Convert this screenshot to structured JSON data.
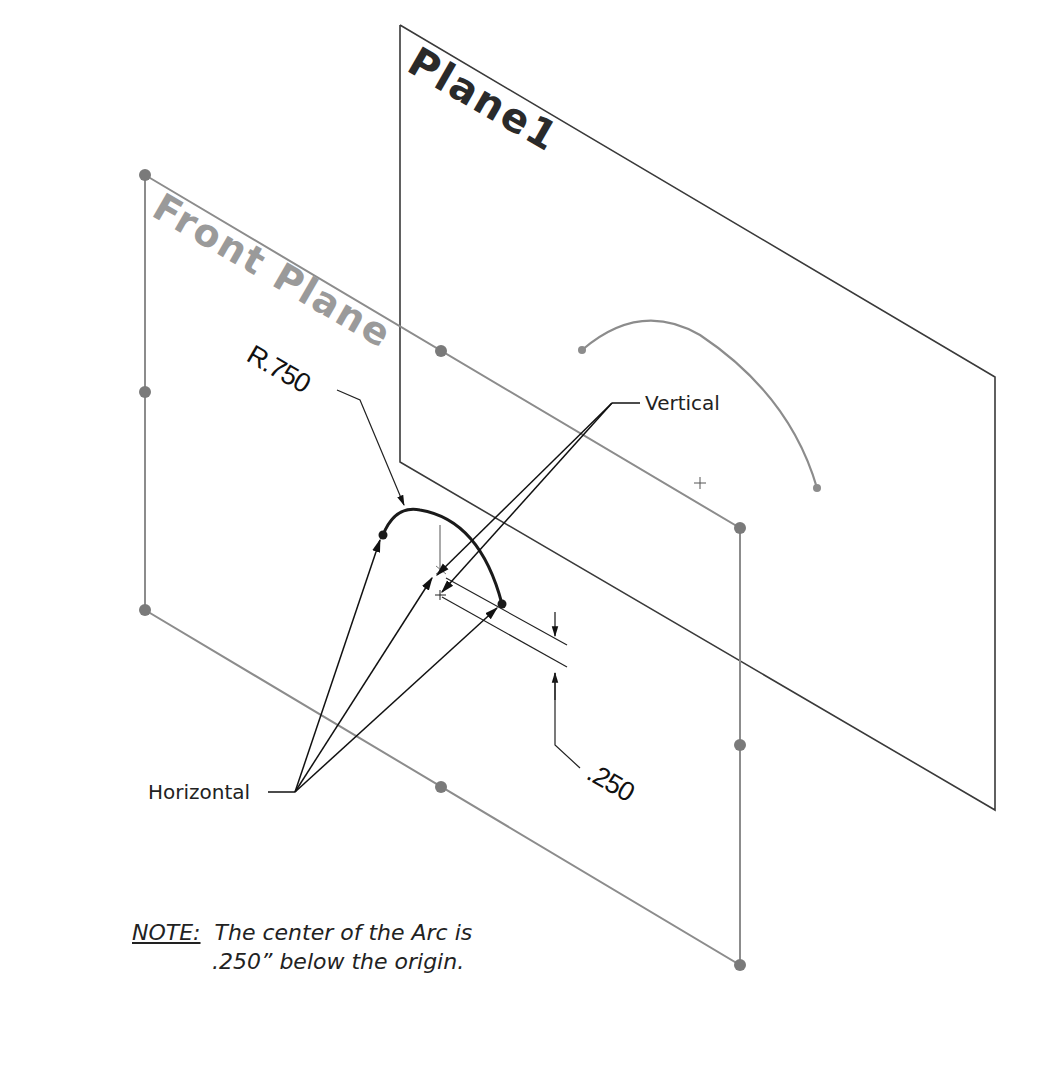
{
  "planes": {
    "plane1_label": "Plane1",
    "front_plane_label": "Front Plane"
  },
  "dimensions": {
    "radius": "R.750",
    "offset": ".250"
  },
  "callouts": {
    "vertical": "Vertical",
    "horizontal": "Horizontal"
  },
  "note": {
    "heading": "NOTE:",
    "line1": "The center of the Arc is",
    "line2": ".250” below the origin."
  },
  "colors": {
    "sketch_dark": "#1a1a1a",
    "plane_grey": "#8c8c8c",
    "handle_grey": "#7a7a7a"
  }
}
